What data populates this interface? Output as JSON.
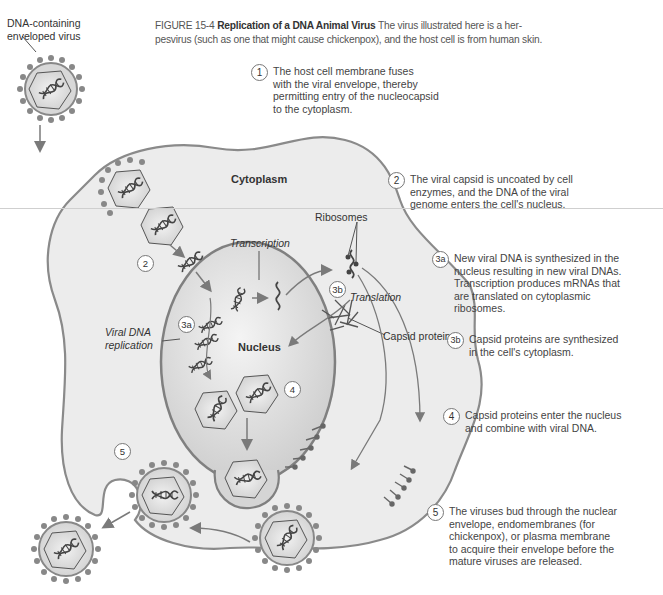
{
  "figure": {
    "number": "FIGURE 15-4",
    "title": "Replication of a DNA Animal Virus",
    "caption_line1": "The virus illustrated here is a her-",
    "caption_line2": "pesvirus (such as one that might cause chickenpox), and the host cell is from human skin."
  },
  "labels": {
    "virus_label_line1": "DNA-containing",
    "virus_label_line2": "enveloped virus",
    "cytoplasm": "Cytoplasm",
    "nucleus": "Nucleus",
    "transcription": "Transcription",
    "translation": "Translation",
    "ribosomes": "Ribosomes",
    "capsid_proteins": "Capsid proteins",
    "viral_dna_replication_line1": "Viral DNA",
    "viral_dna_replication_line2": "replication"
  },
  "markers": {
    "m2": "2",
    "m3a": "3a",
    "m3b": "3b",
    "m4": "4",
    "m5": "5"
  },
  "steps": [
    {
      "num": "1",
      "lines": [
        "The host cell membrane fuses",
        "with the viral envelope, thereby",
        "permitting entry of the nucleocapsid",
        "to the cytoplasm."
      ]
    },
    {
      "num": "2",
      "lines": [
        "The viral capsid is uncoated by cell",
        "enzymes, and the DNA of the viral",
        "genome enters the cell's nucleus."
      ]
    },
    {
      "num": "3a",
      "lines": [
        "New viral DNA is synthesized in the",
        "nucleus resulting in new viral DNAs.",
        "Transcription produces mRNAs that",
        "are translated on cytoplasmic",
        "ribosomes."
      ]
    },
    {
      "num": "3b",
      "lines": [
        "Capsid proteins are synthesized",
        "in the cell's cytoplasm."
      ]
    },
    {
      "num": "4",
      "lines": [
        "Capsid proteins enter the nucleus",
        "and combine with viral DNA."
      ]
    },
    {
      "num": "5",
      "lines": [
        "The viruses bud through the nuclear",
        "envelope, endomembranes (for",
        "chickenpox), or plasma membrane",
        "to acquire their envelope before the",
        "mature viruses are released."
      ]
    }
  ],
  "colors": {
    "cell_fill": "#e9e9e9",
    "cell_stroke": "#8a8a8a",
    "nucleus_fill": "#d4d4d4",
    "arrow": "#7a7a7a",
    "dna": "#444444"
  }
}
